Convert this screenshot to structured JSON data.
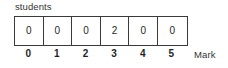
{
  "chart_data": {
    "type": "bar",
    "title": "",
    "subtitle": "",
    "xlabel": "Mark",
    "ylabel": "students",
    "grid": false,
    "legend": null,
    "categories": [
      "0",
      "1",
      "2",
      "3",
      "4",
      "5"
    ],
    "values": [
      0,
      0,
      0,
      2,
      0,
      0
    ],
    "series": [
      {
        "name": "students",
        "values": [
          0,
          0,
          0,
          2,
          0,
          0
        ]
      }
    ],
    "display": "frequency-table-row",
    "cell_labels": [
      "0",
      "0",
      "0",
      "2",
      "0",
      "0"
    ],
    "tick_labels": [
      "0",
      "1",
      "2",
      "3",
      "4",
      "5"
    ],
    "ylim": [
      0,
      2
    ]
  },
  "chart": {
    "series_caption": "students",
    "axis_title": "Mark",
    "cells": [
      {
        "label": "0"
      },
      {
        "label": "0"
      },
      {
        "label": "0"
      },
      {
        "label": "2"
      },
      {
        "label": "0"
      },
      {
        "label": "0"
      }
    ],
    "ticks": [
      {
        "label": "0"
      },
      {
        "label": "1"
      },
      {
        "label": "2"
      },
      {
        "label": "3"
      },
      {
        "label": "4"
      },
      {
        "label": "5"
      }
    ],
    "colors": {
      "background": "#ffffff",
      "border": "#3a3a3a",
      "text": "#1f1f1f",
      "caption_text": "#333333"
    }
  }
}
